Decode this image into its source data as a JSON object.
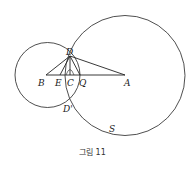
{
  "figure": {
    "caption": "그림 11",
    "points": {
      "A": "A",
      "B": "B",
      "C": "C",
      "D": "D",
      "D_prime": "D'",
      "E": "E",
      "Q": "Q",
      "S": "S"
    }
  }
}
